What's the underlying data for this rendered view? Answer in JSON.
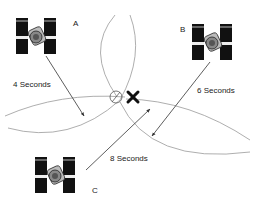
{
  "diagram": {
    "satellites": [
      {
        "id": "A",
        "label": "A",
        "time_label": "4 Seconds"
      },
      {
        "id": "B",
        "label": "B",
        "time_label": "6  Seconds"
      },
      {
        "id": "C",
        "label": "C",
        "time_label": "8 Seconds"
      }
    ],
    "markers": {
      "intersection": "circle-with-x",
      "receiver_position": "X"
    },
    "colors": {
      "line": "#444444",
      "arc": "#999999",
      "panel": "#111111",
      "background": "#ffffff"
    }
  }
}
